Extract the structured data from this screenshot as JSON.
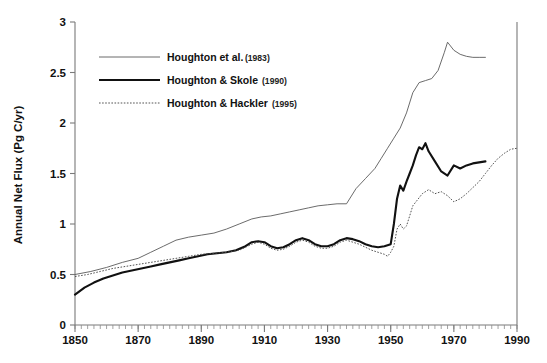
{
  "chart_data": {
    "type": "line",
    "title": "",
    "xlabel": "",
    "ylabel": "Annual Net Flux (Pg C/yr)",
    "xlim": [
      1850,
      1990
    ],
    "ylim": [
      0,
      3
    ],
    "grid": false,
    "legend_position": "upper-left-inside",
    "x_ticks": [
      1850,
      1870,
      1890,
      1910,
      1930,
      1950,
      1970,
      1990
    ],
    "x_tick_labels": [
      "1850",
      "1870",
      "1890",
      "1910",
      "1930",
      "1950",
      "1970",
      "1990"
    ],
    "x_minor_tick_interval": 2,
    "y_ticks": [
      0,
      0.5,
      1,
      1.5,
      2,
      2.5,
      3
    ],
    "y_tick_labels": [
      "0",
      "0.5",
      "1",
      "1.5",
      "2",
      "2.5",
      "3"
    ],
    "series": [
      {
        "name": "Houghton et al.",
        "year": "(1983)",
        "style": "thin-solid",
        "color": "#5a5a5a",
        "x": [
          1850,
          1855,
          1860,
          1865,
          1870,
          1874,
          1878,
          1882,
          1886,
          1890,
          1894,
          1898,
          1902,
          1906,
          1909,
          1912,
          1915,
          1918,
          1921,
          1924,
          1927,
          1930,
          1933,
          1936,
          1939,
          1942,
          1945,
          1947,
          1949,
          1951,
          1953,
          1955,
          1957,
          1959,
          1961,
          1963,
          1965,
          1967,
          1968,
          1970,
          1972,
          1974,
          1976,
          1978,
          1980
        ],
        "y": [
          0.5,
          0.53,
          0.57,
          0.62,
          0.66,
          0.72,
          0.78,
          0.84,
          0.87,
          0.89,
          0.91,
          0.95,
          1.0,
          1.05,
          1.07,
          1.08,
          1.1,
          1.12,
          1.14,
          1.16,
          1.18,
          1.19,
          1.2,
          1.2,
          1.35,
          1.45,
          1.55,
          1.65,
          1.75,
          1.85,
          1.95,
          2.1,
          2.3,
          2.4,
          2.42,
          2.44,
          2.52,
          2.7,
          2.8,
          2.72,
          2.68,
          2.66,
          2.65,
          2.65,
          2.65
        ]
      },
      {
        "name": "Houghton & Skole",
        "year": "(1990)",
        "style": "thick-solid",
        "color": "#111111",
        "x": [
          1850,
          1853,
          1856,
          1859,
          1862,
          1865,
          1868,
          1871,
          1874,
          1877,
          1880,
          1883,
          1886,
          1889,
          1892,
          1895,
          1898,
          1901,
          1904,
          1906,
          1908,
          1910,
          1912,
          1914,
          1916,
          1918,
          1920,
          1922,
          1924,
          1926,
          1928,
          1930,
          1932,
          1934,
          1936,
          1938,
          1940,
          1942,
          1944,
          1946,
          1948,
          1950,
          1951,
          1952,
          1953,
          1954,
          1955,
          1956,
          1957,
          1958,
          1959,
          1960,
          1961,
          1962,
          1964,
          1966,
          1968,
          1970,
          1972,
          1974,
          1976,
          1978,
          1980
        ],
        "y": [
          0.3,
          0.37,
          0.42,
          0.46,
          0.49,
          0.52,
          0.54,
          0.56,
          0.58,
          0.6,
          0.62,
          0.64,
          0.66,
          0.68,
          0.7,
          0.71,
          0.72,
          0.74,
          0.78,
          0.82,
          0.83,
          0.82,
          0.78,
          0.76,
          0.77,
          0.8,
          0.84,
          0.86,
          0.84,
          0.8,
          0.78,
          0.78,
          0.8,
          0.84,
          0.86,
          0.85,
          0.83,
          0.8,
          0.78,
          0.77,
          0.78,
          0.8,
          1.0,
          1.25,
          1.38,
          1.33,
          1.42,
          1.5,
          1.58,
          1.68,
          1.76,
          1.74,
          1.8,
          1.72,
          1.62,
          1.52,
          1.48,
          1.58,
          1.55,
          1.58,
          1.6,
          1.61,
          1.62
        ]
      },
      {
        "name": "Houghton & Hackler",
        "year": "(1995)",
        "style": "dotted",
        "color": "#4a4a4a",
        "x": [
          1850,
          1854,
          1858,
          1862,
          1866,
          1870,
          1874,
          1878,
          1882,
          1886,
          1890,
          1894,
          1898,
          1902,
          1906,
          1908,
          1910,
          1912,
          1914,
          1916,
          1918,
          1920,
          1922,
          1924,
          1926,
          1928,
          1930,
          1932,
          1934,
          1936,
          1938,
          1940,
          1942,
          1944,
          1946,
          1948,
          1949,
          1950,
          1951,
          1952,
          1953,
          1954,
          1955,
          1956,
          1957,
          1958,
          1959,
          1960,
          1962,
          1964,
          1966,
          1968,
          1970,
          1972,
          1974,
          1976,
          1978,
          1980,
          1982,
          1984,
          1986,
          1988,
          1990
        ],
        "y": [
          0.48,
          0.5,
          0.53,
          0.56,
          0.58,
          0.6,
          0.62,
          0.64,
          0.66,
          0.68,
          0.7,
          0.71,
          0.72,
          0.74,
          0.8,
          0.82,
          0.8,
          0.76,
          0.74,
          0.75,
          0.78,
          0.82,
          0.84,
          0.82,
          0.78,
          0.76,
          0.76,
          0.78,
          0.82,
          0.84,
          0.82,
          0.8,
          0.77,
          0.74,
          0.72,
          0.7,
          0.68,
          0.72,
          0.78,
          0.95,
          1.0,
          0.95,
          0.98,
          1.08,
          1.18,
          1.22,
          1.26,
          1.3,
          1.34,
          1.3,
          1.32,
          1.28,
          1.22,
          1.25,
          1.3,
          1.36,
          1.42,
          1.5,
          1.58,
          1.65,
          1.7,
          1.74,
          1.75
        ]
      }
    ]
  },
  "legend": {
    "entries": [
      {
        "label": "Houghton et al.",
        "year": "(1983)"
      },
      {
        "label": "Houghton & Skole",
        "year": "(1990)"
      },
      {
        "label": "Houghton & Hackler",
        "year": "(1995)"
      }
    ]
  }
}
